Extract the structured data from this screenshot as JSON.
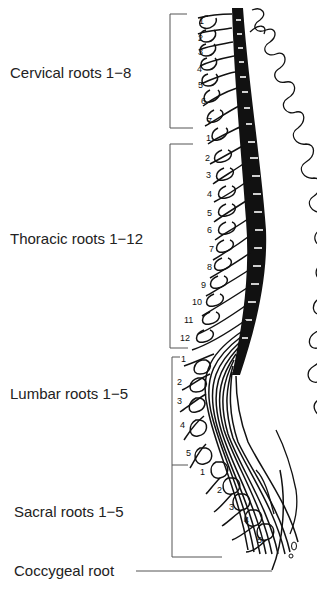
{
  "regions": [
    {
      "label": "Cervical roots 1−8",
      "top": 62,
      "bracket": [
        14,
        128
      ],
      "numbers": [
        "1",
        "2",
        "3",
        "4",
        "5",
        "6",
        "7"
      ]
    },
    {
      "label": "Thoracic roots 1−12",
      "top": 228,
      "bracket": [
        144,
        348
      ],
      "numbers": [
        "1",
        "2",
        "3",
        "4",
        "5",
        "6",
        "7",
        "8",
        "9",
        "10",
        "11",
        "12"
      ]
    },
    {
      "label": "Lumbar roots 1−5",
      "top": 385,
      "bracket": [
        356,
        465
      ],
      "numbers": [
        "1",
        "2",
        "3",
        "4",
        "5"
      ]
    },
    {
      "label": "Sacral roots 1−5",
      "top": 500,
      "bracket": [
        465,
        557
      ],
      "numbers": [
        "1",
        "2",
        "3",
        "4",
        "5"
      ]
    }
  ],
  "coccygeal": {
    "label": "Coccygeal root"
  },
  "colors": {
    "ink": "#111111",
    "background": "#ffffff"
  }
}
